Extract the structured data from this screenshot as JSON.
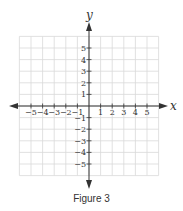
{
  "figure": {
    "caption": "Figure 3",
    "x_axis_label": "x",
    "y_axis_label": "y",
    "x_tick_labels": [
      "−5",
      "−4",
      "−3",
      "−2",
      "−1",
      "1",
      "2",
      "3",
      "4",
      "5"
    ],
    "y_tick_labels": [
      "5",
      "4",
      "3",
      "2",
      "1",
      "−1",
      "−2",
      "−3",
      "−4",
      "−5"
    ],
    "grid_range": {
      "x": [
        -6,
        6
      ],
      "y": [
        -6,
        6
      ]
    },
    "colors": {
      "axis": "#333333",
      "grid": "#d9d9d9",
      "background": "#ffffff"
    }
  }
}
